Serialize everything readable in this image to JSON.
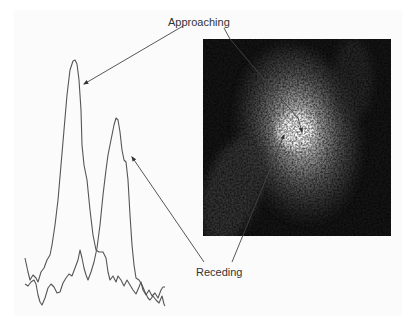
{
  "figure": {
    "labels": {
      "approaching": "Approaching",
      "receding": "Receding"
    },
    "spectrum": {
      "description": "Two emission-line profiles: approaching (blueshifted, taller) and receding (redshifted) components",
      "curves": [
        {
          "name": "approaching-profile",
          "peak_xy": [
            74,
            60
          ],
          "color": "#555555"
        },
        {
          "name": "receding-profile",
          "peak_xy": [
            117,
            117
          ],
          "color": "#555555"
        }
      ]
    },
    "image": {
      "description": "Grayscale galaxy image with two circled nuclei",
      "markers": [
        {
          "name": "receding-nucleus-circle",
          "cx": 288,
          "cy": 125,
          "r": 7
        },
        {
          "name": "approaching-nucleus-circle",
          "cx": 306,
          "cy": 144,
          "r": 7
        }
      ]
    },
    "colors": {
      "background": "#fbfbfb",
      "line": "#555555",
      "image_bg": "#141414",
      "text": "#333333"
    }
  }
}
